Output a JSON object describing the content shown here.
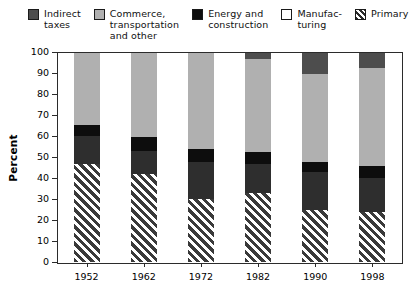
{
  "legend": {
    "items": [
      {
        "label": "Indirect\ntaxes",
        "swatch": "indirect",
        "color": "#4d4d4d"
      },
      {
        "label": "Commerce,\ntransportation\nand other",
        "swatch": "commerce",
        "color": "#b0b0b0"
      },
      {
        "label": "Energy and\nconstruction",
        "swatch": "energy",
        "color": "#0d0d0d"
      },
      {
        "label": "Manufac-\nturing",
        "swatch": "manufacturing",
        "color": "#2e2e2e"
      },
      {
        "label": "Primary",
        "swatch": "primary",
        "color": "#3a3a3a"
      }
    ]
  },
  "chart_data": {
    "type": "bar",
    "stacked": true,
    "title": "",
    "xlabel": "",
    "ylabel": "Percent",
    "ylim": [
      0,
      100
    ],
    "yticks": [
      0,
      10,
      20,
      30,
      40,
      50,
      60,
      70,
      80,
      90,
      100
    ],
    "ytick_labels": [
      "0",
      "10",
      "20",
      "30",
      "40",
      "50",
      "60",
      "70",
      "80",
      "90",
      "100"
    ],
    "grid": false,
    "legend_position": "top",
    "categories": [
      "1952",
      "1962",
      "1972",
      "1982",
      "1990",
      "1998"
    ],
    "series": [
      {
        "name": "Primary",
        "values": [
          47,
          42,
          30,
          33,
          25,
          24
        ]
      },
      {
        "name": "Manufacturing",
        "values": [
          13.5,
          11,
          18,
          14,
          18,
          16
        ]
      },
      {
        "name": "Energy and construction",
        "values": [
          5,
          7,
          6,
          5.5,
          5,
          6
        ]
      },
      {
        "name": "Commerce, transportation and other",
        "values": [
          34.5,
          40,
          46,
          44.5,
          42,
          47
        ]
      },
      {
        "name": "Indirect taxes",
        "values": [
          0,
          0,
          0,
          3,
          10,
          7
        ]
      }
    ]
  }
}
